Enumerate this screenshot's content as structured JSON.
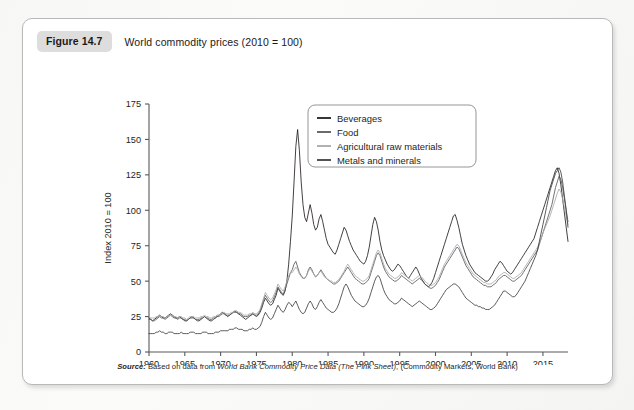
{
  "figure": {
    "badge": "Figure 14.7",
    "title": "World commodity prices (2010  =  100)",
    "source_prefix": "Source:",
    "source_mid": " Based on data from ",
    "source_italic": "World Bank Commodity Price Data (The Pink Sheet)",
    "source_suffix": ", (Commodity Markets, World Bank)"
  },
  "colors": {
    "beverages": "#231f20",
    "food": "#595a5c",
    "agricultural": "#a7a9ac",
    "metals": "#404042",
    "axis": "#58595b",
    "badge_bg": "#dddddd",
    "figure_border": "#b9b9b9"
  },
  "chart_data": {
    "type": "line",
    "title": "World commodity prices (2010 = 100)",
    "xlabel": "",
    "ylabel": "Index 2010 = 100",
    "xlim": [
      1960,
      2018.5
    ],
    "ylim": [
      0,
      175
    ],
    "yticks": [
      0,
      25,
      50,
      75,
      100,
      125,
      150,
      175
    ],
    "ytick_labels": [
      "0",
      "25",
      "50",
      "75",
      "100",
      "125",
      "150",
      "175"
    ],
    "xticks": [
      1960,
      1965,
      1970,
      1975,
      1980,
      1985,
      1990,
      1995,
      2000,
      2005,
      2010,
      2015
    ],
    "xtick_labels": [
      "1960",
      "1965",
      "1970",
      "1975",
      "1980",
      "1985",
      "1990",
      "1995",
      "2000",
      "2005",
      "2010",
      "2015"
    ],
    "grid": false,
    "legend_position": "top-center",
    "x_start": 1960,
    "x_step": 0.25,
    "series": [
      {
        "name": "Beverages",
        "color": "#231f20",
        "values": [
          24,
          23,
          22,
          23,
          24,
          25,
          26,
          25,
          24,
          24,
          25,
          26,
          27,
          26,
          25,
          24,
          24,
          25,
          24,
          23,
          22,
          22,
          23,
          24,
          25,
          24,
          23,
          22,
          22,
          23,
          24,
          25,
          24,
          23,
          22,
          22,
          23,
          24,
          25,
          26,
          27,
          28,
          27,
          26,
          25,
          26,
          27,
          28,
          29,
          28,
          27,
          26,
          25,
          24,
          23,
          24,
          25,
          26,
          27,
          26,
          25,
          26,
          28,
          31,
          35,
          38,
          36,
          34,
          33,
          34,
          37,
          40,
          45,
          43,
          41,
          40,
          43,
          50,
          62,
          78,
          96,
          120,
          145,
          157,
          142,
          120,
          104,
          95,
          92,
          98,
          104,
          98,
          90,
          86,
          88,
          94,
          97,
          92,
          86,
          80,
          76,
          74,
          72,
          70,
          69,
          72,
          76,
          80,
          84,
          88,
          86,
          82,
          78,
          75,
          72,
          70,
          68,
          66,
          64,
          63,
          62,
          64,
          68,
          74,
          82,
          90,
          95,
          92,
          86,
          78,
          72,
          68,
          65,
          62,
          60,
          58,
          57,
          58,
          60,
          62,
          61,
          59,
          57,
          55,
          53,
          52,
          54,
          56,
          58,
          60,
          58,
          55,
          52,
          50,
          48,
          47,
          46,
          47,
          49,
          52,
          56,
          60,
          64,
          68,
          72,
          76,
          80,
          84,
          88,
          92,
          96,
          97,
          93,
          88,
          82,
          76,
          72,
          68,
          65,
          62,
          60,
          58,
          56,
          55,
          54,
          53,
          52,
          51,
          50,
          50,
          51,
          53,
          55,
          58,
          60,
          62,
          64,
          63,
          61,
          59,
          57,
          56,
          55,
          56,
          58,
          60,
          62,
          64,
          66,
          68,
          70,
          72,
          74,
          76,
          78,
          80,
          84,
          88,
          92,
          96,
          100,
          104,
          108,
          112,
          116,
          120,
          124,
          128,
          130,
          126,
          118,
          108,
          98,
          88,
          78,
          70,
          62,
          56,
          52,
          58,
          66,
          74,
          82,
          90,
          98,
          106,
          112,
          118,
          124,
          128,
          130,
          126,
          120,
          114,
          108,
          104,
          100,
          97,
          95,
          93,
          91,
          89,
          88,
          90,
          92,
          94,
          93,
          91,
          88,
          85,
          82,
          80,
          78,
          76,
          74,
          73,
          72,
          74,
          78,
          82,
          86,
          88,
          86,
          84,
          82,
          80,
          78,
          77,
          76,
          78,
          80,
          82,
          84,
          86,
          88,
          86,
          84,
          82
        ]
      },
      {
        "name": "Food",
        "color": "#595a5c",
        "values": [
          23,
          23,
          22,
          22,
          23,
          24,
          25,
          24,
          24,
          23,
          24,
          25,
          26,
          25,
          24,
          24,
          23,
          24,
          24,
          23,
          23,
          22,
          23,
          24,
          24,
          24,
          23,
          23,
          23,
          24,
          24,
          25,
          24,
          24,
          23,
          23,
          24,
          24,
          25,
          25,
          26,
          27,
          27,
          26,
          26,
          26,
          27,
          28,
          28,
          28,
          27,
          27,
          26,
          25,
          25,
          25,
          26,
          26,
          27,
          26,
          26,
          27,
          29,
          33,
          37,
          40,
          38,
          36,
          35,
          36,
          39,
          42,
          46,
          44,
          42,
          41,
          44,
          48,
          52,
          56,
          58,
          62,
          64,
          60,
          56,
          54,
          52,
          52,
          54,
          58,
          60,
          58,
          55,
          53,
          54,
          56,
          58,
          56,
          54,
          52,
          51,
          50,
          49,
          48,
          48,
          49,
          50,
          52,
          54,
          56,
          58,
          60,
          58,
          56,
          54,
          52,
          51,
          50,
          49,
          48,
          48,
          49,
          50,
          52,
          56,
          60,
          64,
          68,
          70,
          68,
          64,
          60,
          57,
          55,
          53,
          52,
          51,
          50,
          50,
          51,
          52,
          54,
          53,
          52,
          51,
          50,
          49,
          48,
          49,
          50,
          51,
          52,
          51,
          50,
          48,
          47,
          46,
          45,
          45,
          46,
          47,
          49,
          51,
          54,
          57,
          60,
          62,
          64,
          66,
          68,
          70,
          72,
          74,
          73,
          70,
          67,
          64,
          61,
          59,
          57,
          55,
          53,
          52,
          51,
          50,
          49,
          48,
          47,
          47,
          46,
          46,
          46,
          47,
          48,
          49,
          51,
          52,
          53,
          54,
          54,
          53,
          52,
          51,
          50,
          50,
          51,
          52,
          53,
          54,
          56,
          58,
          60,
          62,
          64,
          66,
          68,
          70,
          72,
          76,
          80,
          84,
          88,
          92,
          96,
          100,
          104,
          110,
          116,
          120,
          124,
          122,
          116,
          108,
          100,
          92,
          84,
          76,
          70,
          64,
          58,
          56,
          62,
          70,
          78,
          86,
          94,
          102,
          108,
          112,
          116,
          120,
          122,
          120,
          116,
          110,
          104,
          98,
          94,
          90,
          88,
          86,
          84,
          83,
          82,
          82,
          84,
          86,
          88,
          87,
          85,
          82,
          80,
          78,
          76,
          74,
          73,
          72,
          71,
          70,
          72,
          75,
          78,
          81,
          82,
          81,
          80,
          78,
          77,
          76,
          75,
          74,
          76,
          78,
          80,
          82,
          84,
          86,
          84,
          82,
          80
        ]
      },
      {
        "name": "Agricultural raw materials",
        "color": "#a7a9ac",
        "values": [
          25,
          24,
          24,
          24,
          25,
          25,
          26,
          25,
          25,
          24,
          25,
          26,
          26,
          26,
          25,
          25,
          24,
          25,
          25,
          24,
          24,
          23,
          24,
          25,
          25,
          25,
          24,
          24,
          24,
          25,
          25,
          26,
          25,
          25,
          24,
          24,
          25,
          25,
          26,
          26,
          27,
          27,
          28,
          27,
          27,
          27,
          28,
          28,
          29,
          29,
          28,
          28,
          27,
          26,
          26,
          26,
          27,
          27,
          28,
          27,
          27,
          28,
          30,
          34,
          38,
          42,
          40,
          38,
          37,
          38,
          41,
          44,
          48,
          46,
          44,
          43,
          46,
          50,
          54,
          56,
          56,
          58,
          60,
          58,
          55,
          53,
          52,
          52,
          54,
          57,
          59,
          57,
          55,
          53,
          54,
          56,
          57,
          55,
          53,
          52,
          51,
          50,
          50,
          49,
          49,
          50,
          51,
          53,
          55,
          57,
          60,
          62,
          60,
          58,
          56,
          54,
          53,
          52,
          51,
          50,
          50,
          51,
          52,
          54,
          58,
          62,
          66,
          70,
          72,
          70,
          66,
          62,
          59,
          57,
          55,
          54,
          53,
          52,
          52,
          53,
          54,
          56,
          55,
          54,
          53,
          52,
          51,
          50,
          51,
          52,
          53,
          54,
          53,
          52,
          50,
          49,
          48,
          47,
          47,
          48,
          49,
          51,
          53,
          56,
          59,
          62,
          64,
          66,
          68,
          70,
          72,
          74,
          76,
          75,
          72,
          69,
          66,
          63,
          61,
          59,
          57,
          55,
          54,
          53,
          52,
          51,
          50,
          49,
          49,
          48,
          48,
          48,
          49,
          50,
          51,
          53,
          54,
          55,
          56,
          56,
          55,
          54,
          53,
          52,
          52,
          53,
          54,
          55,
          56,
          58,
          60,
          62,
          64,
          66,
          68,
          70,
          72,
          74,
          77,
          80,
          84,
          87,
          90,
          93,
          96,
          100,
          104,
          108,
          112,
          115,
          113,
          108,
          102,
          96,
          90,
          84,
          78,
          72,
          66,
          60,
          58,
          64,
          71,
          78,
          85,
          92,
          98,
          104,
          108,
          112,
          116,
          118,
          116,
          112,
          107,
          102,
          97,
          93,
          90,
          88,
          87,
          85,
          84,
          83,
          83,
          85,
          87,
          89,
          88,
          86,
          83,
          81,
          79,
          77,
          75,
          74,
          73,
          72,
          71,
          73,
          76,
          79,
          82,
          83,
          82,
          81,
          79,
          78,
          77,
          76,
          75,
          77,
          79,
          81,
          83,
          85,
          87,
          85,
          83,
          81
        ]
      },
      {
        "name": "Metals and minerals",
        "color": "#404042",
        "values": [
          13,
          13,
          13,
          13,
          14,
          14,
          15,
          14,
          14,
          13,
          13,
          14,
          14,
          14,
          13,
          13,
          13,
          13,
          14,
          13,
          13,
          13,
          13,
          14,
          14,
          14,
          13,
          13,
          13,
          13,
          14,
          14,
          14,
          13,
          13,
          13,
          13,
          14,
          14,
          14,
          15,
          15,
          15,
          15,
          15,
          16,
          16,
          16,
          17,
          17,
          16,
          16,
          16,
          15,
          15,
          15,
          16,
          16,
          17,
          16,
          16,
          17,
          18,
          21,
          25,
          28,
          26,
          24,
          23,
          24,
          27,
          30,
          33,
          31,
          29,
          28,
          30,
          33,
          35,
          34,
          32,
          34,
          36,
          33,
          30,
          28,
          27,
          28,
          31,
          34,
          36,
          34,
          31,
          30,
          32,
          35,
          37,
          35,
          33,
          31,
          30,
          29,
          28,
          28,
          29,
          31,
          34,
          38,
          42,
          46,
          48,
          46,
          43,
          40,
          38,
          36,
          35,
          34,
          33,
          32,
          32,
          33,
          35,
          38,
          42,
          46,
          50,
          53,
          54,
          52,
          48,
          44,
          41,
          39,
          37,
          36,
          35,
          34,
          34,
          35,
          36,
          38,
          37,
          36,
          35,
          34,
          33,
          32,
          33,
          34,
          35,
          36,
          35,
          34,
          33,
          32,
          31,
          30,
          30,
          31,
          32,
          34,
          36,
          38,
          40,
          42,
          44,
          45,
          46,
          47,
          48,
          48,
          47,
          46,
          44,
          42,
          40,
          38,
          37,
          36,
          35,
          34,
          33,
          33,
          32,
          32,
          31,
          31,
          30,
          30,
          30,
          31,
          32,
          33,
          35,
          37,
          39,
          41,
          43,
          43,
          42,
          41,
          40,
          39,
          39,
          40,
          42,
          44,
          46,
          48,
          50,
          53,
          56,
          59,
          62,
          65,
          68,
          72,
          78,
          84,
          90,
          96,
          102,
          108,
          114,
          118,
          122,
          126,
          128,
          130,
          127,
          120,
          110,
          100,
          88,
          76,
          66,
          58,
          52,
          48,
          50,
          58,
          68,
          78,
          88,
          98,
          108,
          116,
          122,
          126,
          130,
          132,
          128,
          122,
          114,
          106,
          98,
          92,
          88,
          86,
          84,
          82,
          80,
          78,
          76,
          75,
          74,
          73,
          72,
          70,
          68,
          66,
          64,
          62,
          60,
          58,
          56,
          55,
          54,
          56,
          60,
          64,
          68,
          70,
          69,
          67,
          65,
          64,
          63,
          62,
          61,
          64,
          68,
          72,
          76,
          80,
          84,
          82,
          80,
          78
        ]
      }
    ]
  }
}
